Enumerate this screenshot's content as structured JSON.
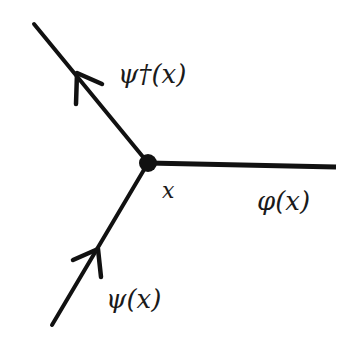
{
  "diagram": {
    "type": "feynman-vertex",
    "vertex": {
      "label": "x",
      "x": 148,
      "y": 163
    },
    "lines": [
      {
        "name": "psi-dagger",
        "label": "ψ†(x)",
        "direction": "outgoing",
        "end": [
          34,
          24
        ]
      },
      {
        "name": "phi",
        "label": "φ(x)",
        "direction": "none",
        "end": [
          336,
          167
        ]
      },
      {
        "name": "psi",
        "label": "ψ(x)",
        "direction": "incoming",
        "end": [
          52,
          325
        ]
      }
    ],
    "colors": {
      "ink": "#111111",
      "background": "#ffffff"
    }
  },
  "labels": {
    "psi_dagger": "ψ†(x)",
    "vertex": "x",
    "phi": "φ(x)",
    "psi": "ψ(x)"
  }
}
